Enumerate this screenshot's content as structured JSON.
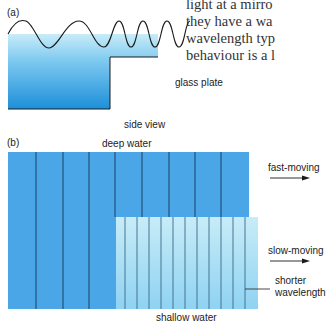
{
  "body_text": {
    "lines": [
      "light at a mirro",
      "they have a wa",
      "wavelength typ",
      "behaviour is a l"
    ]
  },
  "panel_a": {
    "label": "(a)",
    "plate_label": "glass plate",
    "caption": "side view"
  },
  "panel_b": {
    "label": "(b)",
    "top_label": "deep water",
    "bottom_label": "shallow water",
    "fast_label": "fast-moving",
    "slow_label": "slow-moving",
    "shorter_label_1": "shorter",
    "shorter_label_2": "wavelength"
  },
  "colors": {
    "deep_blue": "#4aa6e6",
    "shallow_blue": "#c8ecf8",
    "line_dark": "#1d3e66"
  }
}
